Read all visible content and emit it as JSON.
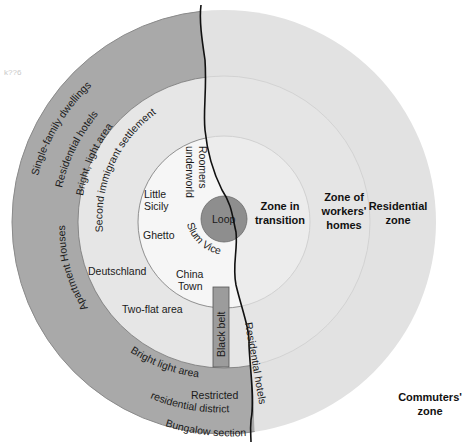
{
  "diagram": {
    "center": {
      "x": 224,
      "y": 222
    },
    "rings": [
      {
        "id": "loop",
        "label": "Loop",
        "radius": 23,
        "fill": "#8e8e8e"
      },
      {
        "id": "zone-in-transition",
        "label": "Zone in transition",
        "radius": 85,
        "fill_left": "#f3f3f3",
        "fill_right": "#ebebeb"
      },
      {
        "id": "zone-of-workers-homes",
        "label": "Zone of workers' homes",
        "radius": 143,
        "fill_left": "#e6e6e6",
        "fill_right": "#e3e3e3"
      },
      {
        "id": "residential-zone",
        "label": "Residential zone",
        "radius": 210,
        "fill_left": "#a9a9a9",
        "fill_right": "#e0e0e0"
      },
      {
        "id": "commuters-zone",
        "label": "Commuters' zone",
        "fill": "#ffffff"
      }
    ],
    "zone_labels": {
      "transition_line1": "Zone in",
      "transition_line2": "transition",
      "workers_line1": "Zone of",
      "workers_line2": "workers'",
      "workers_line3": "homes",
      "residential_line1": "Residential",
      "residential_line2": "zone",
      "commuters_line1": "Commuters'",
      "commuters_line2": "zone",
      "loop": "Loop"
    },
    "district_labels": {
      "single_family": "Single-family dwellings",
      "residential_hotels_top": "Residential hotels",
      "bright_light_top": "Bright, light area",
      "second_immigrant": "Second immigrant settlement",
      "roomers": "Roomers",
      "underworld": "underworld",
      "little_sicily_1": "Little",
      "little_sicily_2": "Sicily",
      "ghetto": "Ghetto",
      "slum_vice": "Slum Vice",
      "deutschland": "Deutschland",
      "china_town_1": "China",
      "china_town_2": "Town",
      "two_flat": "Two-flat area",
      "black_belt": "Black belt",
      "apartment_houses": "Apartment Houses",
      "bright_light_bottom": "Bright light area",
      "residential_hotels_bottom": "Residential hotels",
      "restricted_1": "Restricted",
      "restricted_2": "residential district",
      "bungalow": "Bungalow section"
    },
    "corner_mark": "k??6",
    "colors": {
      "divider_line": "#111111",
      "ring_border": "#cfcfcf",
      "dark_ring": "#a9a9a9",
      "loop_fill": "#8e8e8e",
      "black_belt_fill": "#9c9c9c"
    }
  }
}
